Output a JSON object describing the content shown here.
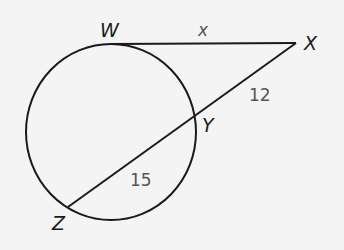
{
  "diagram": {
    "type": "circle with tangent and secant",
    "points": {
      "W": "W",
      "X": "X",
      "Y": "Y",
      "Z": "Z"
    },
    "segments": {
      "tangent_WX": "x",
      "external_XY": "12",
      "internal_YZ": "15"
    },
    "colors": {
      "stroke": "#1a1a1a",
      "background": "#f4f4f4",
      "measure_text": "#555555"
    }
  }
}
